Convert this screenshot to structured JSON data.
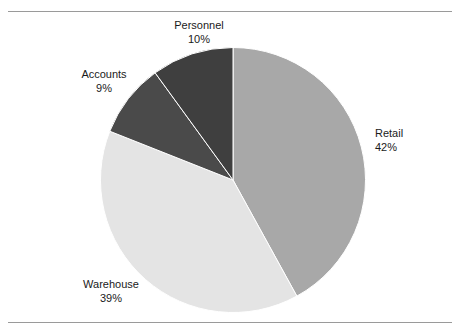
{
  "figure": {
    "background_color": "#ffffff",
    "rule_color": "#9a9a9a",
    "text_color": "#1a1a1a"
  },
  "chart_data": {
    "type": "pie",
    "title": "",
    "subtitle": "",
    "xlabel": "",
    "ylabel": "",
    "legend_position": "none",
    "grid": false,
    "label_format": "name + percent on two lines, placed outside slice",
    "start_angle_deg": 0,
    "direction": "clockwise",
    "categories": [
      "Retail",
      "Warehouse",
      "Accounts",
      "Personnel"
    ],
    "values": [
      42,
      39,
      9,
      10
    ],
    "units": "%",
    "slices": [
      {
        "name": "Retail",
        "value": 42,
        "percent_label": "42%",
        "color": "#a8a8a8",
        "start_deg": 0,
        "end_deg": 151.2
      },
      {
        "name": "Warehouse",
        "value": 39,
        "percent_label": "39%",
        "color": "#e4e4e4",
        "start_deg": 151.2,
        "end_deg": 291.6
      },
      {
        "name": "Accounts",
        "value": 9,
        "percent_label": "9%",
        "color": "#4a4a4a",
        "start_deg": 291.6,
        "end_deg": 324.0
      },
      {
        "name": "Personnel",
        "value": 10,
        "percent_label": "10%",
        "color": "#3f3f3f",
        "start_deg": 324.0,
        "end_deg": 360.0
      }
    ],
    "slice_border_color": "#ffffff",
    "slice_border_width": 1
  }
}
